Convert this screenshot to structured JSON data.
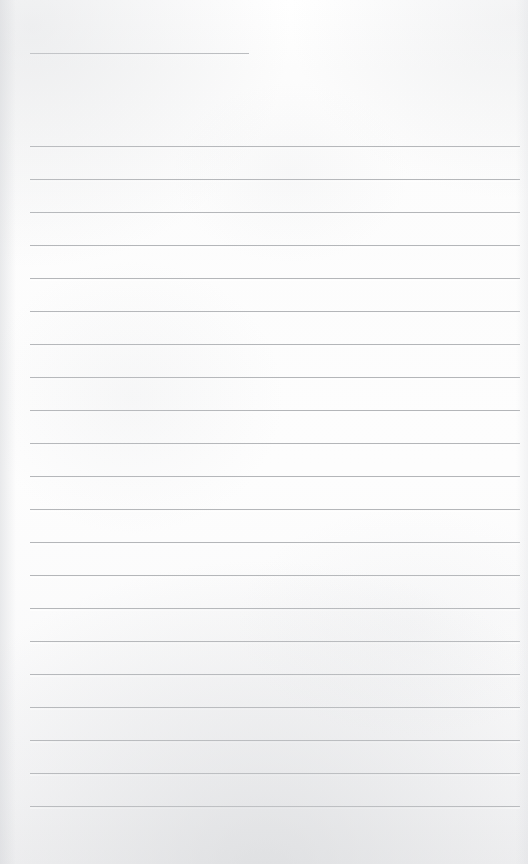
{
  "document": {
    "kind": "lined-notepad-page",
    "title_text": "",
    "body_text": "",
    "page_width": 528,
    "page_height": 864,
    "paper_color": "#fdfdfd",
    "rule_color": "#b4b6b9",
    "header_rule_color": "#b9bbbe"
  },
  "header_rule": {
    "name": "name-date-rule",
    "x": 30,
    "y": 53,
    "width": 219,
    "thickness": 1,
    "color": "#b9bbbe",
    "value": ""
  },
  "body_rules": {
    "count": 21,
    "first_y": 146,
    "spacing": 33,
    "x": 30,
    "width": 490,
    "thickness": 1,
    "color": "#b4b6b9",
    "lines": [
      {
        "index": 1,
        "y": 146,
        "value": ""
      },
      {
        "index": 2,
        "y": 179,
        "value": ""
      },
      {
        "index": 3,
        "y": 212,
        "value": ""
      },
      {
        "index": 4,
        "y": 245,
        "value": ""
      },
      {
        "index": 5,
        "y": 278,
        "value": ""
      },
      {
        "index": 6,
        "y": 311,
        "value": ""
      },
      {
        "index": 7,
        "y": 344,
        "value": ""
      },
      {
        "index": 8,
        "y": 377,
        "value": ""
      },
      {
        "index": 9,
        "y": 410,
        "value": ""
      },
      {
        "index": 10,
        "y": 443,
        "value": ""
      },
      {
        "index": 11,
        "y": 476,
        "value": ""
      },
      {
        "index": 12,
        "y": 509,
        "value": ""
      },
      {
        "index": 13,
        "y": 542,
        "value": ""
      },
      {
        "index": 14,
        "y": 575,
        "value": ""
      },
      {
        "index": 15,
        "y": 608,
        "value": ""
      },
      {
        "index": 16,
        "y": 641,
        "value": ""
      },
      {
        "index": 17,
        "y": 674,
        "value": ""
      },
      {
        "index": 18,
        "y": 707,
        "value": ""
      },
      {
        "index": 19,
        "y": 740,
        "value": ""
      },
      {
        "index": 20,
        "y": 773,
        "value": ""
      },
      {
        "index": 21,
        "y": 806,
        "value": ""
      }
    ]
  },
  "margins": {
    "top_blank_height": 53,
    "bottom_blank_height": 58,
    "left": 30,
    "right": 8
  }
}
